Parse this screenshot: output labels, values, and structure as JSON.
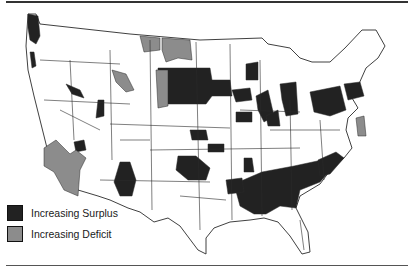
{
  "figure": {
    "type": "choropleth map"
  },
  "colors": {
    "surplus": "#222222",
    "deficit": "#8c8c8c",
    "neutral": "#ffffff",
    "border": "#2a2a2a"
  },
  "legend": {
    "items": [
      {
        "label": "Increasing Surplus",
        "color": "#222222"
      },
      {
        "label": "Increasing Deficit",
        "color": "#8c8c8c"
      }
    ]
  }
}
